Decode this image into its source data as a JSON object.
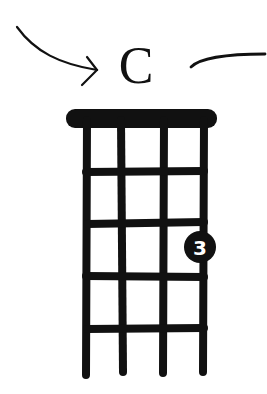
{
  "chord": {
    "name": "C",
    "instrument_strings": 4,
    "frets_shown": 5,
    "fingerings": [
      {
        "string": 4,
        "fret": 3,
        "finger": "3"
      }
    ]
  },
  "colors": {
    "ink": "#111111",
    "background": "#ffffff",
    "finger_text": "#ffffff"
  },
  "decorations": {
    "left": "curved-arrow-pointing-to-chord-name",
    "right": "curved-line"
  }
}
